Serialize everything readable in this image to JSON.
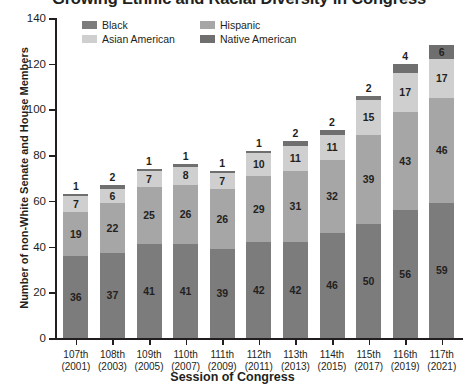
{
  "chart_data": {
    "type": "bar",
    "subtype": "stacked",
    "title": "Growing Ethnic and Racial Diversity in Congress",
    "xlabel": "Session of Congress",
    "ylabel": "Number of non-White Senate and House Members",
    "ylim": [
      0,
      140
    ],
    "yticks": [
      0,
      20,
      40,
      60,
      80,
      100,
      120,
      140
    ],
    "grid": false,
    "legend_position": "top-inside",
    "categories": [
      "107th\n(2001)",
      "108th\n(2003)",
      "109th\n(2005)",
      "110th\n(2007)",
      "111th\n(2009)",
      "112th\n(2011)",
      "113th\n(2013)",
      "114th\n(2015)",
      "115th\n(2017)",
      "116th\n(2019)",
      "117th\n(2021)"
    ],
    "category_congress": [
      "107th",
      "108th",
      "109th",
      "110th",
      "111th",
      "112th",
      "113th",
      "114th",
      "115th",
      "116th",
      "117th"
    ],
    "category_years": [
      "(2001)",
      "(2003)",
      "(2005)",
      "(2007)",
      "(2009)",
      "(2011)",
      "(2013)",
      "(2015)",
      "(2017)",
      "(2019)",
      "(2021)"
    ],
    "series": [
      {
        "name": "Black",
        "color": "#7c7c7c",
        "values": [
          36,
          37,
          41,
          41,
          39,
          42,
          42,
          46,
          50,
          56,
          59
        ]
      },
      {
        "name": "Hispanic",
        "color": "#a6a6a6",
        "values": [
          19,
          22,
          25,
          26,
          26,
          29,
          31,
          32,
          39,
          43,
          46
        ]
      },
      {
        "name": "Asian American",
        "color": "#cfcfcf",
        "values": [
          7,
          6,
          7,
          8,
          7,
          10,
          11,
          11,
          15,
          17,
          17
        ]
      },
      {
        "name": "Native American",
        "color": "#6f6f6f",
        "values": [
          1,
          2,
          1,
          1,
          1,
          1,
          2,
          2,
          2,
          4,
          6
        ]
      }
    ],
    "totals": [
      63,
      67,
      74,
      76,
      73,
      82,
      86,
      91,
      106,
      120,
      128
    ]
  },
  "legend": {
    "items": [
      {
        "label": "Black",
        "color": "#7c7c7c"
      },
      {
        "label": "Hispanic",
        "color": "#a6a6a6"
      },
      {
        "label": "Asian American",
        "color": "#cfcfcf"
      },
      {
        "label": "Native American",
        "color": "#6f6f6f"
      }
    ]
  },
  "colors": {
    "axis": "#231f20",
    "text": "#231f20",
    "background": "#ffffff"
  }
}
